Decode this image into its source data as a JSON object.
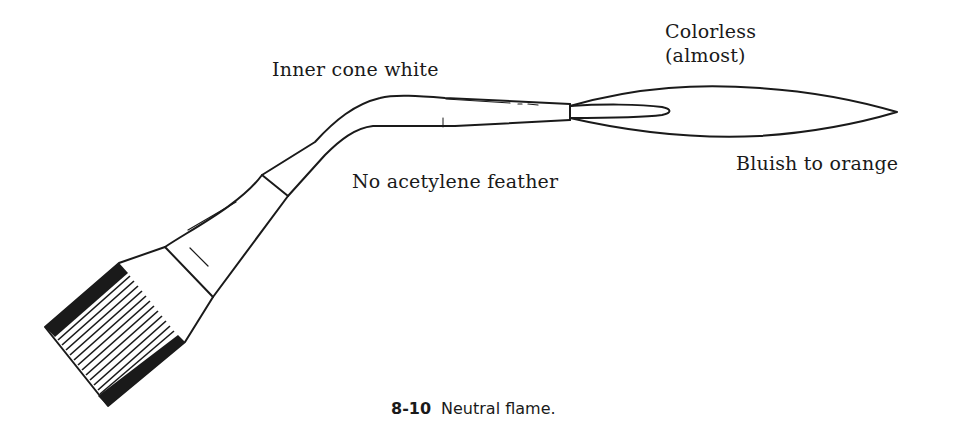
{
  "diagram": {
    "labels": {
      "inner_cone": "Inner cone white",
      "outer_envelope_line1": "Colorless",
      "outer_envelope_line2": "(almost)",
      "no_feather": "No acetylene feather",
      "outer_color": "Bluish to orange"
    },
    "caption": {
      "number": "8-10",
      "text": "Neutral flame."
    },
    "colors": {
      "line": "#1a1a1a",
      "background": "#ffffff"
    }
  }
}
